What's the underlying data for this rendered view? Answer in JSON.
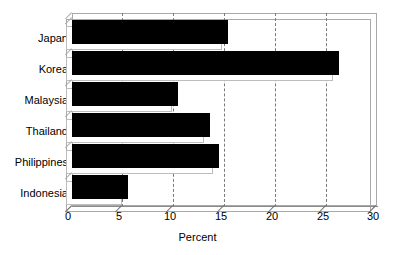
{
  "chart_data": {
    "type": "bar",
    "orientation": "horizontal",
    "title": "",
    "xlabel": "Percent",
    "ylabel": "",
    "categories": [
      "Japan",
      "Korea",
      "Malaysia",
      "Thailand",
      "Philippines",
      "Indonesia"
    ],
    "values": [
      15.3,
      26.3,
      10.4,
      13.6,
      14.5,
      5.5
    ],
    "xlim": [
      0,
      30
    ],
    "xticks": [
      0,
      5,
      10,
      15,
      20,
      25,
      30
    ],
    "xticklabels": [
      "0",
      "5",
      "10",
      "15",
      "20",
      "25",
      "30"
    ],
    "grid": "vertical-dashed",
    "legend": "none",
    "bar_color": "#000000",
    "frame_color": "#a9a9a9",
    "gridline_color": "#7a7a7a",
    "background_color": "#ffffff"
  }
}
